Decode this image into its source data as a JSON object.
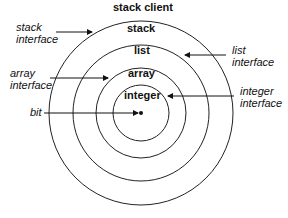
{
  "diagram": {
    "layers": [
      {
        "label": "stack client"
      },
      {
        "label": "stack"
      },
      {
        "label": "list"
      },
      {
        "label": "array"
      },
      {
        "label": "integer"
      }
    ],
    "interfaces": {
      "stack": {
        "line1": "stack",
        "line2": "interface"
      },
      "list": {
        "line1": "list",
        "line2": "interface"
      },
      "array": {
        "line1": "array",
        "line2": "interface"
      },
      "integer": {
        "line1": "integer",
        "line2": "interface"
      }
    },
    "bit": {
      "label": "bit"
    }
  }
}
